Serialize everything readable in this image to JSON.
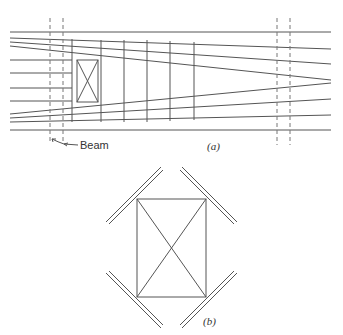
{
  "figure_a": {
    "caption": "(a)",
    "beam_label": "Beam",
    "stroke_color": "#555555"
  },
  "figure_b": {
    "caption": "(b)",
    "stroke_color": "#555555"
  }
}
